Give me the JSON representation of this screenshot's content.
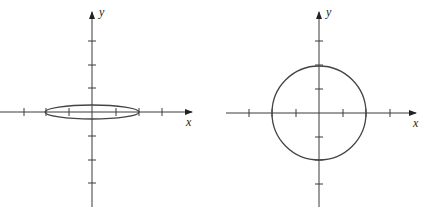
{
  "diagrams": [
    {
      "name": "ellipse-plot",
      "x_label": "x",
      "y_label": "y",
      "x_ticks": [
        -3,
        -2,
        -1,
        1,
        2,
        3
      ],
      "y_ticks": [
        -3,
        -2,
        -1,
        1,
        2,
        3
      ],
      "curve": {
        "type": "ellipse",
        "center": [
          0,
          0
        ],
        "rx": 2,
        "ry": 0.3
      }
    },
    {
      "name": "circle-plot",
      "x_label": "x",
      "y_label": "y",
      "x_ticks": [
        -3,
        -2,
        -1,
        1,
        2,
        3
      ],
      "y_ticks": [
        -3,
        -2,
        -1,
        1,
        2,
        3
      ],
      "curve": {
        "type": "circle",
        "center": [
          0,
          0
        ],
        "r": 2
      }
    }
  ],
  "colors": {
    "axis": "#3a3a3a",
    "curve": "#444444",
    "background": "#ffffff"
  }
}
